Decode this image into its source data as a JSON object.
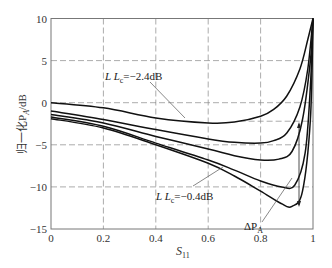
{
  "chart_data": {
    "type": "line",
    "title": "",
    "xlabel": "S11",
    "xlabel_main": "S",
    "xlabel_sub": "11",
    "ylabel": "归一化P_A/dB",
    "ylabel_text": "归一化P",
    "ylabel_sub": "A",
    "ylabel_unit": "/dB",
    "xlim": [
      0,
      1
    ],
    "ylim": [
      -15,
      10
    ],
    "xticks": [
      0,
      0.2,
      0.4,
      0.6,
      0.8,
      1
    ],
    "xtick_labels": [
      "0",
      "0.2",
      "0.4",
      "0.6",
      "0.8",
      "1"
    ],
    "yticks": [
      10,
      5,
      0,
      -5,
      -10,
      -15
    ],
    "ytick_labels": [
      "10",
      "5",
      "0",
      "−5",
      "−10",
      "−15"
    ],
    "grid": true,
    "grid_style": "dashed",
    "extra_hline_right": -2.2,
    "series": [
      {
        "name": "L Lc = -2.4dB",
        "x": [
          0,
          0.2,
          0.4,
          0.6,
          0.7,
          0.8,
          0.85,
          0.9,
          0.95,
          0.98,
          1.0
        ],
        "values": [
          0,
          -0.6,
          -1.8,
          -2.4,
          -2.3,
          -1.6,
          -0.8,
          0.8,
          4,
          7.5,
          10
        ]
      },
      {
        "name": "curve-2",
        "x": [
          0,
          0.2,
          0.4,
          0.6,
          0.7,
          0.8,
          0.85,
          0.9,
          0.95,
          0.98,
          1.0
        ],
        "values": [
          -1,
          -2,
          -3.2,
          -4.3,
          -4.7,
          -4.8,
          -4.5,
          -3.6,
          -0.5,
          4,
          10
        ]
      },
      {
        "name": "curve-3",
        "x": [
          0,
          0.2,
          0.4,
          0.6,
          0.7,
          0.8,
          0.87,
          0.92,
          0.96,
          0.99,
          1.0
        ],
        "values": [
          -1.4,
          -2.4,
          -4,
          -5.5,
          -6.3,
          -6.8,
          -6.7,
          -5.8,
          -2,
          5,
          10
        ]
      },
      {
        "name": "curve-4",
        "x": [
          0,
          0.2,
          0.4,
          0.6,
          0.7,
          0.8,
          0.88,
          0.93,
          0.97,
          0.99,
          1.0
        ],
        "values": [
          -1.7,
          -2.8,
          -4.8,
          -6.8,
          -8,
          -9.3,
          -10,
          -9.8,
          -6,
          2,
          10
        ]
      },
      {
        "name": "L Lc = -0.4dB",
        "x": [
          0,
          0.2,
          0.4,
          0.6,
          0.7,
          0.8,
          0.88,
          0.92,
          0.96,
          0.99,
          1.0
        ],
        "values": [
          -1.9,
          -3,
          -5,
          -7.2,
          -8.7,
          -10.5,
          -12,
          -12.3,
          -10.5,
          -2,
          10
        ]
      }
    ],
    "annotations": [
      {
        "text": "L Lc=−2.4dB",
        "main": "L L",
        "sub": "c",
        "rest": "=−2.4dB",
        "target_series": 0
      },
      {
        "text": "L Lc=−0.4dB",
        "main": "L L",
        "sub": "c",
        "rest": "=−0.4dB",
        "target_series": 4
      },
      {
        "text": "ΔP_A",
        "main": "ΔP",
        "sub": "A",
        "spans": "difference between curve-2 min and curve-5 min at S11≈0.92"
      }
    ],
    "legend": "none"
  },
  "colors": {
    "line": "#111111",
    "grid": "#888888",
    "frame": "#777777",
    "text": "#333333"
  }
}
